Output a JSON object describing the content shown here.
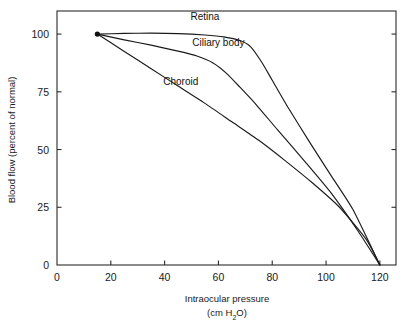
{
  "chart_data": {
    "type": "line",
    "title": "",
    "xlabel": "Intraocular pressure",
    "xlabel_units": "(cm H2O)",
    "xlabel_units_pre": "(cm H",
    "xlabel_units_sub": "2",
    "xlabel_units_post": "O)",
    "ylabel": "Blood flow (percent of normal)",
    "xlim": [
      0,
      126
    ],
    "ylim": [
      0,
      110
    ],
    "xticks": [
      0,
      20,
      40,
      60,
      80,
      100,
      120
    ],
    "xtick_labels": [
      "0",
      "20",
      "40",
      "60",
      "80",
      "100",
      "120"
    ],
    "yticks": [
      0,
      25,
      50,
      75,
      100
    ],
    "ytick_labels": [
      "0",
      "25",
      "50",
      "75",
      "100"
    ],
    "grid": false,
    "legend_position": "inline-annotations",
    "line_color": "#1a1a1a",
    "origin_marker": {
      "x": 15,
      "y": 100,
      "style": "filled-circle"
    },
    "series": [
      {
        "name": "Retina",
        "label": "Retina",
        "label_x": 55,
        "label_y": 106,
        "x": [
          15,
          25,
          35,
          45,
          55,
          62,
          68,
          72,
          76,
          80,
          86,
          94,
          102,
          110,
          120
        ],
        "y": [
          100,
          100.3,
          100.4,
          100.2,
          99.6,
          98.8,
          97.2,
          94.5,
          88.0,
          80.0,
          68.0,
          53.0,
          38.5,
          24.0,
          0
        ]
      },
      {
        "name": "Ciliary body",
        "label": "Ciliary body",
        "label_x": 60,
        "label_y": 95,
        "x": [
          15,
          25,
          35,
          45,
          52,
          58,
          63,
          68,
          74,
          82,
          92,
          102,
          112,
          120
        ],
        "y": [
          100,
          97.5,
          95.2,
          92.6,
          90.5,
          87.5,
          83.0,
          77.0,
          69.5,
          58.5,
          45.0,
          31.0,
          14.5,
          0
        ]
      },
      {
        "name": "Choroid",
        "label": "Choroid",
        "label_x": 46,
        "label_y": 78,
        "x": [
          15,
          25,
          35,
          45,
          55,
          65,
          75,
          85,
          95,
          105,
          115,
          120
        ],
        "y": [
          100,
          92.5,
          85.0,
          77.5,
          70.0,
          62.0,
          54.0,
          45.0,
          35.5,
          25.0,
          11.0,
          0
        ]
      }
    ]
  }
}
